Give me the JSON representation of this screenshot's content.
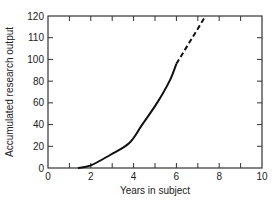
{
  "chart_data": {
    "type": "line",
    "title": "",
    "xlabel": "Years in subject",
    "ylabel": "Accumulated research output",
    "xlim": [
      0,
      10
    ],
    "x_ticks": [
      0,
      2,
      4,
      6,
      8,
      10
    ],
    "x_minor_ticks": [
      1,
      3,
      5,
      7,
      9
    ],
    "y_tick_labels": [
      "0",
      "20",
      "40",
      "60",
      "80",
      "100",
      "110",
      "120"
    ],
    "y_tick_note": "Tick labels are printed at equal spacing as shown in the figure",
    "grid": false,
    "legend": null,
    "series": [
      {
        "name": "observed",
        "style": "solid",
        "points": [
          {
            "x": 1.4,
            "y_idx": 0.0
          },
          {
            "x": 2.0,
            "y_idx": 0.12
          },
          {
            "x": 2.9,
            "y_idx": 0.6
          },
          {
            "x": 3.8,
            "y_idx": 1.15
          },
          {
            "x": 4.4,
            "y_idx": 2.0
          },
          {
            "x": 5.1,
            "y_idx": 3.0
          },
          {
            "x": 5.7,
            "y_idx": 4.05
          },
          {
            "x": 6.0,
            "y_idx": 4.8
          }
        ]
      },
      {
        "name": "extrapolated",
        "style": "dashed",
        "points": [
          {
            "x": 6.0,
            "y_idx": 4.8
          },
          {
            "x": 7.3,
            "y_idx": 6.9
          }
        ]
      }
    ]
  }
}
